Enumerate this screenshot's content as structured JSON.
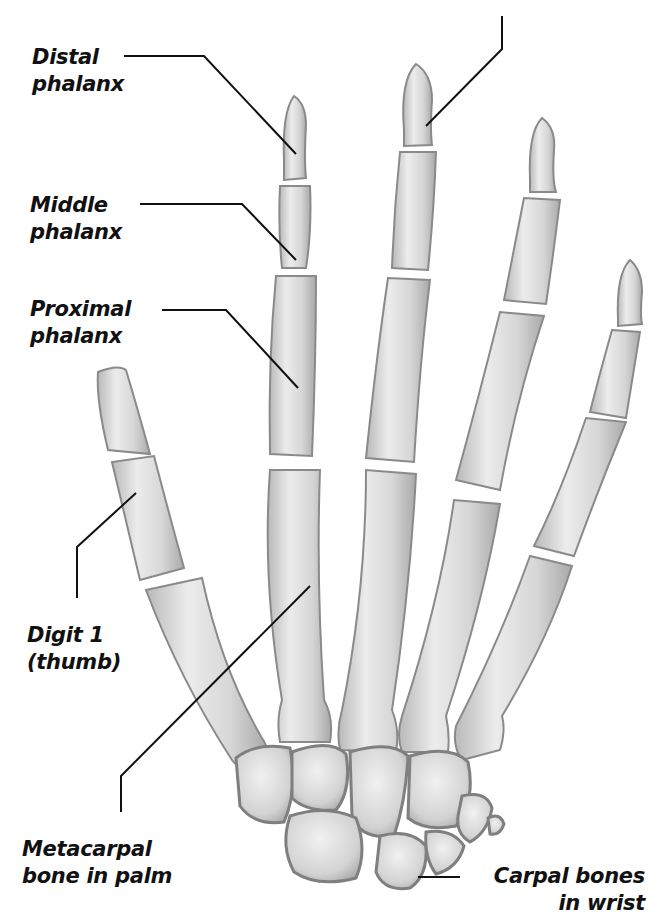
{
  "figure": {
    "colors": {
      "bone_fill": "#d9d9d9",
      "bone_light": "#efefef",
      "bone_edge": "#8a8a8a",
      "leader_line": "#111111",
      "text": "#111111"
    }
  },
  "labels": {
    "distal": {
      "line1": "Distal",
      "line2": "phalanx"
    },
    "middle": {
      "line1": "Middle",
      "line2": "phalanx"
    },
    "proximal": {
      "line1": "Proximal",
      "line2": "phalanx"
    },
    "digit1": {
      "line1": "Digit 1",
      "line2": "(thumb)"
    },
    "metacarpal": {
      "line1": "Metacarpal",
      "line2": "bone in palm"
    },
    "carpal": {
      "line1": "Carpal bones",
      "line2": "in wrist"
    }
  }
}
